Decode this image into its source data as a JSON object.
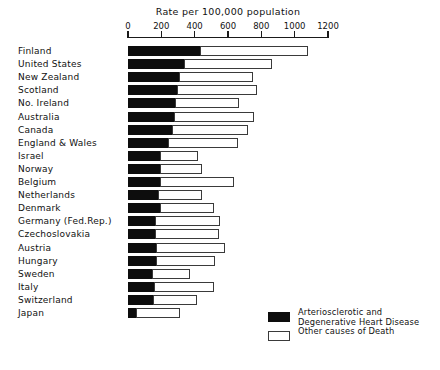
{
  "chart_data": {
    "type": "bar",
    "orientation": "horizontal",
    "stacked": true,
    "title": "Rate per  100,000  population",
    "xlabel": "Rate per  100,000  population",
    "ylabel": "",
    "xlim": [
      0,
      1200
    ],
    "grid": false,
    "tick_labels": [
      "0",
      "200",
      "400",
      "600",
      "800",
      "1000",
      "1200"
    ],
    "ticks": [
      0,
      200,
      400,
      600,
      800,
      1000,
      1200
    ],
    "legend_position": "bottom-right",
    "categories": [
      "Finland",
      "United States",
      "New Zealand",
      "Scotland",
      "No. Ireland",
      "Australia",
      "Canada",
      "England & Wales",
      "Israel",
      "Norway",
      "Belgium",
      "Netherlands",
      "Denmark",
      "Germany  (Fed.Rep.)",
      "Czechoslovakia",
      "Austria",
      "Hungary",
      "Sweden",
      "Italy",
      "Switzerland",
      "Japan"
    ],
    "series": [
      {
        "name": "Arteriosclerotic and\nDegenerative Heart Disease",
        "color": "#0d0d0d",
        "values": [
          430,
          335,
          305,
          295,
          280,
          275,
          265,
          240,
          190,
          190,
          190,
          180,
          190,
          160,
          160,
          165,
          170,
          145,
          155,
          150,
          45
        ]
      },
      {
        "name": "Other causes of Death",
        "color": "#ffffff",
        "values": [
          650,
          530,
          445,
          480,
          385,
          480,
          455,
          420,
          230,
          255,
          445,
          265,
          325,
          390,
          385,
          415,
          350,
          225,
          360,
          265,
          265
        ]
      }
    ],
    "totals": [
      1080,
      865,
      750,
      775,
      665,
      755,
      720,
      660,
      420,
      445,
      635,
      445,
      515,
      550,
      545,
      580,
      520,
      370,
      515,
      415,
      310
    ]
  },
  "legend": {
    "items": [
      {
        "swatch": "black",
        "label": "Arteriosclerotic and\nDegenerative Heart Disease"
      },
      {
        "swatch": "white",
        "label": "Other causes of Death"
      }
    ]
  }
}
